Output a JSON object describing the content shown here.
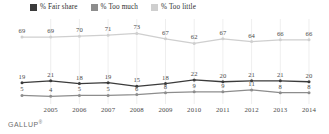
{
  "legend": {
    "items": [
      {
        "label": "% Fair share",
        "color": "#3b3b3b",
        "icon": "legend-swatch-square"
      },
      {
        "label": "% Too much",
        "color": "#8d8d8d",
        "icon": "legend-swatch-square"
      },
      {
        "label": "% Too little",
        "color": "#cfcfcf",
        "icon": "legend-swatch-square"
      }
    ]
  },
  "footer": {
    "brand": "GALLUP",
    "trademark": "®"
  },
  "chart_data": {
    "type": "line",
    "title": "",
    "subtitle": "",
    "xlabel": "",
    "ylabel": "",
    "ylim": [
      0,
      80
    ],
    "grid": true,
    "grid_orientation": "vertical",
    "legend_position": "top-left",
    "categories": [
      "",
      "2005",
      "2006",
      "2007",
      "2008",
      "2009",
      "2010",
      "2011",
      "2012",
      "2013",
      "2014"
    ],
    "tick_labels": [
      "2005",
      "2006",
      "2007",
      "2008",
      "2009",
      "2010",
      "2011",
      "2012",
      "2013",
      "2014"
    ],
    "series": [
      {
        "name": "% Too little",
        "color": "#cfcfcf",
        "values": [
          69,
          69,
          70,
          71,
          73,
          67,
          62,
          67,
          64,
          66,
          66
        ]
      },
      {
        "name": "% Fair share",
        "color": "#3b3b3b",
        "values": [
          19,
          21,
          18,
          19,
          15,
          18,
          22,
          20,
          21,
          21,
          20
        ]
      },
      {
        "name": "% Too much",
        "color": "#8d8d8d",
        "values": [
          5,
          4,
          5,
          5,
          6,
          8,
          9,
          9,
          11,
          8,
          8
        ]
      }
    ]
  }
}
